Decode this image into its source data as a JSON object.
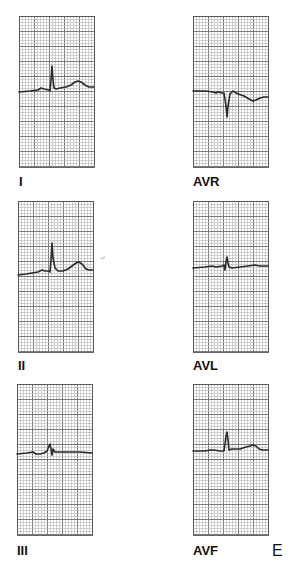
{
  "figure": {
    "letter": "E",
    "background": "#ffffff",
    "grid": {
      "minor_step_px": 3,
      "major_every": 5,
      "minor_color": "#b5b5b5",
      "major_color": "#6e6e6e",
      "border_color": "#555555"
    },
    "trace_color": "#2a2a2a",
    "leads": [
      {
        "name": "I",
        "panel": {
          "x": 19,
          "y": 16,
          "w": 75,
          "h": 151
        },
        "label_pos": {
          "x": 19,
          "y": 175
        },
        "trace": [
          [
            19,
            92
          ],
          [
            30,
            91
          ],
          [
            38,
            90
          ],
          [
            41,
            88
          ],
          [
            44,
            89
          ],
          [
            49,
            90
          ],
          [
            50,
            91
          ],
          [
            51,
            80
          ],
          [
            52,
            66
          ],
          [
            53,
            80
          ],
          [
            54,
            88
          ],
          [
            56,
            89
          ],
          [
            60,
            88
          ],
          [
            66,
            87
          ],
          [
            71,
            85
          ],
          [
            75,
            82
          ],
          [
            78,
            81
          ],
          [
            81,
            82
          ],
          [
            85,
            85
          ],
          [
            89,
            87
          ],
          [
            94,
            87
          ]
        ]
      },
      {
        "name": "AVR",
        "panel": {
          "x": 193,
          "y": 16,
          "w": 75,
          "h": 151
        },
        "label_pos": {
          "x": 193,
          "y": 175
        },
        "trace": [
          [
            193,
            91
          ],
          [
            205,
            91
          ],
          [
            213,
            92
          ],
          [
            216,
            93
          ],
          [
            218,
            92
          ],
          [
            222,
            93
          ],
          [
            224,
            93
          ],
          [
            226,
            106
          ],
          [
            227,
            117
          ],
          [
            228,
            106
          ],
          [
            230,
            94
          ],
          [
            233,
            91
          ],
          [
            238,
            94
          ],
          [
            244,
            96
          ],
          [
            249,
            99
          ],
          [
            253,
            101
          ],
          [
            256,
            100
          ],
          [
            260,
            98
          ],
          [
            264,
            97
          ],
          [
            268,
            97
          ]
        ]
      },
      {
        "name": "II",
        "panel": {
          "x": 18,
          "y": 201,
          "w": 75,
          "h": 151
        },
        "label_pos": {
          "x": 18,
          "y": 359
        },
        "trace": [
          [
            18,
            275
          ],
          [
            26,
            274
          ],
          [
            32,
            273
          ],
          [
            38,
            272
          ],
          [
            42,
            270
          ],
          [
            45,
            271
          ],
          [
            49,
            271
          ],
          [
            50,
            272
          ],
          [
            51,
            260
          ],
          [
            52,
            243
          ],
          [
            53,
            258
          ],
          [
            55,
            268
          ],
          [
            58,
            271
          ],
          [
            63,
            271
          ],
          [
            68,
            269
          ],
          [
            72,
            266
          ],
          [
            76,
            263
          ],
          [
            79,
            262
          ],
          [
            82,
            264
          ],
          [
            86,
            269
          ],
          [
            89,
            270
          ],
          [
            93,
            270
          ]
        ]
      },
      {
        "name": "AVL",
        "panel": {
          "x": 193,
          "y": 201,
          "w": 75,
          "h": 151
        },
        "label_pos": {
          "x": 193,
          "y": 359
        },
        "trace": [
          [
            193,
            268
          ],
          [
            205,
            267
          ],
          [
            212,
            266
          ],
          [
            216,
            267
          ],
          [
            222,
            266
          ],
          [
            224,
            265
          ],
          [
            225,
            270
          ],
          [
            226,
            262
          ],
          [
            227,
            257
          ],
          [
            228,
            263
          ],
          [
            229,
            267
          ],
          [
            232,
            268
          ],
          [
            240,
            267
          ],
          [
            248,
            266
          ],
          [
            255,
            265
          ],
          [
            260,
            266
          ],
          [
            268,
            266
          ]
        ]
      },
      {
        "name": "III",
        "panel": {
          "x": 17,
          "y": 384,
          "w": 75,
          "h": 151
        },
        "label_pos": {
          "x": 17,
          "y": 544
        },
        "trace": [
          [
            17,
            454
          ],
          [
            27,
            453
          ],
          [
            33,
            452
          ],
          [
            36,
            454
          ],
          [
            40,
            454
          ],
          [
            44,
            453
          ],
          [
            47,
            451
          ],
          [
            49,
            446
          ],
          [
            50,
            444
          ],
          [
            51,
            449
          ],
          [
            52,
            455
          ],
          [
            53,
            449
          ],
          [
            55,
            452
          ],
          [
            60,
            452
          ],
          [
            70,
            452
          ],
          [
            80,
            452
          ],
          [
            92,
            453
          ]
        ]
      },
      {
        "name": "AVF",
        "panel": {
          "x": 193,
          "y": 384,
          "w": 75,
          "h": 151
        },
        "label_pos": {
          "x": 193,
          "y": 544
        },
        "trace": [
          [
            193,
            451
          ],
          [
            205,
            451
          ],
          [
            210,
            450
          ],
          [
            214,
            450
          ],
          [
            220,
            451
          ],
          [
            224,
            451
          ],
          [
            225,
            444
          ],
          [
            226,
            436
          ],
          [
            227,
            432
          ],
          [
            228,
            440
          ],
          [
            229,
            450
          ],
          [
            232,
            449
          ],
          [
            240,
            449
          ],
          [
            246,
            447
          ],
          [
            250,
            446
          ],
          [
            253,
            445
          ],
          [
            256,
            446
          ],
          [
            259,
            449
          ],
          [
            263,
            450
          ],
          [
            268,
            450
          ]
        ]
      }
    ],
    "letter_pos": {
      "x": 272,
      "y": 543
    },
    "stray_mark": {
      "x1": 101,
      "y1": 259,
      "x2": 105,
      "y2": 257
    }
  }
}
